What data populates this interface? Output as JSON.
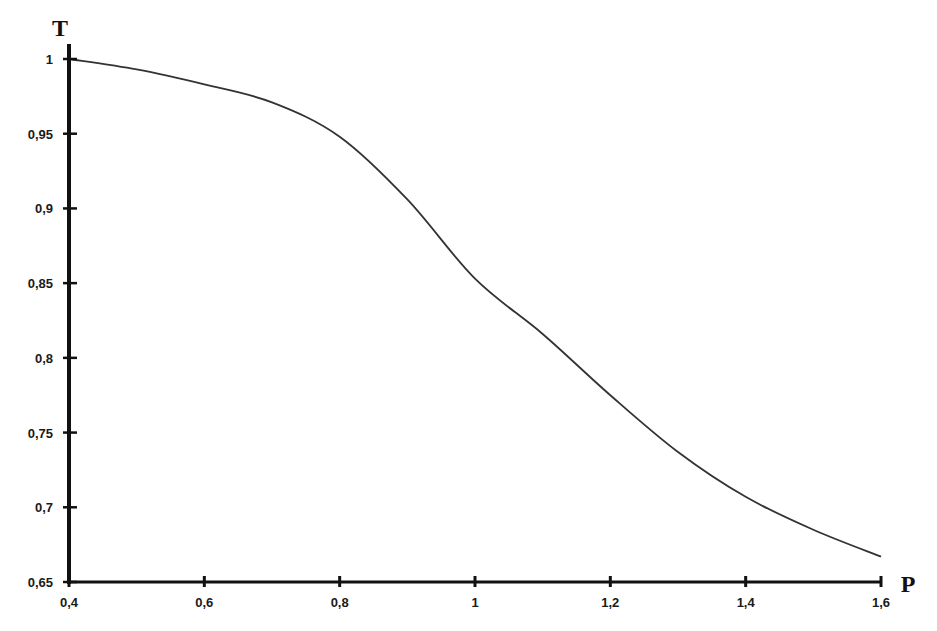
{
  "chart_data": {
    "type": "line",
    "title": "",
    "xlabel": "P",
    "ylabel": "T",
    "xlim": [
      0.4,
      1.6
    ],
    "ylim": [
      0.65,
      1.0
    ],
    "grid": false,
    "legend": null,
    "x_ticks": [
      "0,4",
      "0,6",
      "0,8",
      "1",
      "1,2",
      "1,4",
      "1,6"
    ],
    "x_tick_values": [
      0.4,
      0.6,
      0.8,
      1.0,
      1.2,
      1.4,
      1.6
    ],
    "y_ticks": [
      "1",
      "0,95",
      "0,9",
      "0,85",
      "0,8",
      "0,75",
      "0,7",
      "0,65"
    ],
    "y_tick_values": [
      1.0,
      0.95,
      0.9,
      0.85,
      0.8,
      0.75,
      0.7,
      0.65
    ],
    "series": [
      {
        "name": "T(P)",
        "color": "#333333",
        "x": [
          0.4,
          0.5,
          0.6,
          0.7,
          0.8,
          0.9,
          1.0,
          1.1,
          1.2,
          1.3,
          1.4,
          1.5,
          1.6
        ],
        "y": [
          1.0,
          0.993,
          0.983,
          0.971,
          0.948,
          0.906,
          0.853,
          0.816,
          0.775,
          0.737,
          0.707,
          0.685,
          0.667
        ]
      }
    ]
  },
  "axes": {
    "x_title": "P",
    "y_title": "T",
    "color": "#111111"
  }
}
